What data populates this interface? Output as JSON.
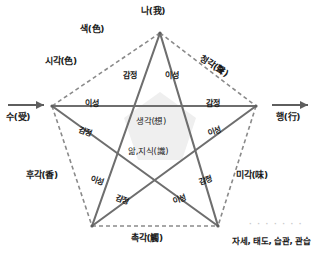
{
  "diagram": {
    "shape": "pentagram",
    "colors": {
      "line": "#6e6e6e",
      "dashed": "#8a8a8a",
      "fill_center": "#efefef",
      "text": "#1a1a1a",
      "dots": "#c9c9c9"
    },
    "vertices": [
      {
        "id": "top",
        "label": "나(我)",
        "x": 160,
        "y": 33
      },
      {
        "id": "left",
        "label": "시각(色)",
        "x": 52,
        "y": 106
      },
      {
        "id": "right",
        "label": "청각(聲)",
        "x": 256,
        "y": 106
      },
      {
        "id": "bottom-left",
        "label": "후각(香)",
        "x": 92,
        "y": 226
      },
      {
        "id": "bottom-right",
        "label": "미각(味)",
        "x": 218,
        "y": 226
      }
    ],
    "outer_labels": [
      {
        "id": "top-vertex",
        "text": "나(我)"
      },
      {
        "id": "color-edge",
        "text": "색(色)"
      },
      {
        "id": "sight",
        "text": "시각(色)"
      },
      {
        "id": "hearing",
        "text": "청각(聲)"
      },
      {
        "id": "smell",
        "text": "후각(香)"
      },
      {
        "id": "taste",
        "text": "미각(味)"
      },
      {
        "id": "touch",
        "text": "촉각(觸)"
      }
    ],
    "axis_labels": {
      "left": {
        "text": "수(受)",
        "arrow": "→"
      },
      "right": {
        "text": "행(行)",
        "arrow": "→"
      }
    },
    "inner_labels": [
      {
        "id": "top-left-spoke",
        "text": "감정"
      },
      {
        "id": "top-right-spoke",
        "text": "이성"
      },
      {
        "id": "left-horizontal",
        "text": "이성"
      },
      {
        "id": "right-horizontal",
        "text": "감정"
      },
      {
        "id": "left-lower-spoke",
        "text": "감정"
      },
      {
        "id": "right-lower-spoke",
        "text": "이성"
      },
      {
        "id": "bottom-left-outer",
        "text": "이성"
      },
      {
        "id": "bottom-right-outer",
        "text": "감정"
      },
      {
        "id": "bottom-left-inner",
        "text": "감정"
      },
      {
        "id": "bottom-right-inner",
        "text": "이성"
      }
    ],
    "center_labels": [
      {
        "id": "thought",
        "text": "생각(想)"
      },
      {
        "id": "knowledge",
        "text": "앎,지식(識)"
      }
    ],
    "caption": "자세, 태도, 습관, 관습",
    "dot_row": "· · · · · · ·"
  }
}
